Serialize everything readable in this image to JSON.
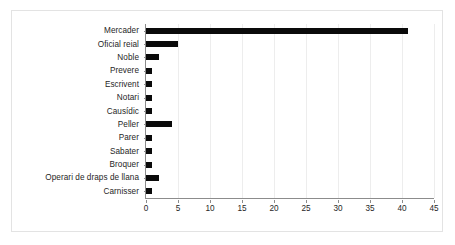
{
  "chart_data": {
    "type": "bar",
    "orientation": "horizontal",
    "title": "",
    "xlabel": "",
    "ylabel": "",
    "categories": [
      "Mercader",
      "Oficial reial",
      "Noble",
      "Prevere",
      "Escrivent",
      "Notari",
      "Causídic",
      "Peller",
      "Parer",
      "Sabater",
      "Broquer",
      "Operari de draps de llana",
      "Carnisser"
    ],
    "values": [
      41,
      5,
      2,
      1,
      1,
      1,
      1,
      4,
      1,
      1,
      1,
      2,
      1
    ],
    "xlim": [
      0,
      45
    ],
    "xticks": [
      0,
      5,
      10,
      15,
      20,
      25,
      30,
      35,
      40,
      45
    ],
    "xticklabels": [
      "0",
      "5",
      "10",
      "15",
      "20",
      "25",
      "30",
      "35",
      "40",
      "45"
    ],
    "grid": "vertical",
    "legend": "none",
    "bar_color": "#0a0a0a",
    "gridline_color": "#ededed",
    "axis_color": "#8c8c8c",
    "background_color": "#ffffff",
    "border_color": "#e3e3e3"
  }
}
